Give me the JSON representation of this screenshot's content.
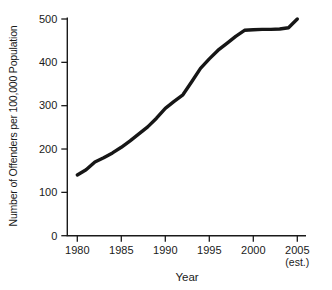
{
  "figure": {
    "background_color": "#ffffff",
    "axis_color": "#1a1a1a",
    "line_color": "#161616",
    "text_color": "#1a1a1a"
  },
  "chart_data": {
    "type": "line",
    "title": "",
    "xlabel": "Year",
    "ylabel": "Number of Offenders per 100,000 Population",
    "x_ticks": [
      1980,
      1985,
      1990,
      1995,
      2000,
      2005
    ],
    "x_last_tick_note": "(est.)",
    "y_ticks": [
      0,
      100,
      200,
      300,
      400,
      500
    ],
    "xlim": [
      1978.8,
      2006.2
    ],
    "ylim": [
      0,
      500
    ],
    "grid": false,
    "legend_position": "none",
    "series": [
      {
        "name": "Number of offenders per 100,000 population",
        "x": [
          1980,
          1981,
          1982,
          1983,
          1984,
          1985,
          1986,
          1987,
          1988,
          1989,
          1990,
          1991,
          1992,
          1993,
          1994,
          1995,
          1996,
          1997,
          1998,
          1999,
          2000,
          2001,
          2002,
          2003,
          2004,
          2005
        ],
        "values": [
          140,
          152,
          170,
          180,
          191,
          204,
          219,
          235,
          251,
          271,
          294,
          310,
          325,
          355,
          386,
          408,
          428,
          444,
          460,
          474,
          475,
          476,
          476,
          477,
          480,
          500
        ]
      }
    ]
  }
}
